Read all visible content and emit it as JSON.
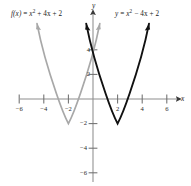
{
  "figure": {
    "axes": {
      "x_name": "x",
      "y_name": "y"
    },
    "labels": {
      "left_eq_fn": "f(x)",
      "left_eq_eq": " = ",
      "left_eq_x": "x",
      "left_eq_pow": "2",
      "left_eq_rest": " + 4x + 2",
      "right_eq_fn": "y",
      "right_eq_eq": " = ",
      "right_eq_x": "x",
      "right_eq_pow": "2",
      "right_eq_rest": " − 4x + 2"
    }
  },
  "chart_data": {
    "type": "line",
    "title": "",
    "xlabel": "x",
    "ylabel": "y",
    "xlim": [
      -7.6,
      7.9
    ],
    "ylim": [
      -7.1,
      6.5
    ],
    "grid": false,
    "legend": "none",
    "xticks": [
      -6,
      -4,
      -2,
      2,
      4,
      6
    ],
    "xtick_labels": [
      "−6",
      "−4",
      "−2",
      "2",
      "4",
      "6"
    ],
    "yticks": [
      4,
      2,
      -2,
      -4,
      -6
    ],
    "ytick_labels": [
      "4",
      "2",
      "−2",
      "−4",
      "−6"
    ],
    "series": [
      {
        "name": "f(x) = x² + 4x + 2",
        "color": "#a8a8a8",
        "equation": "y = x^2 + 4x + 2",
        "vertex": [
          -2,
          -2
        ],
        "y_intercept": 2,
        "x_domain": [
          -4.55,
          0.55
        ],
        "x": [
          -4.55,
          -4.2,
          -3.8,
          -3.4,
          -3.0,
          -2.6,
          -2.2,
          -2.0,
          -1.8,
          -1.4,
          -1.0,
          -0.6,
          -0.2,
          0.2,
          0.55
        ],
        "y": [
          4.5,
          2.84,
          1.24,
          -0.04,
          -1.0,
          -1.64,
          -1.96,
          -2.0,
          -1.96,
          -1.64,
          -1.0,
          -0.04,
          1.24,
          2.84,
          4.5
        ]
      },
      {
        "name": "y = x² − 4x + 2",
        "color": "#111111",
        "equation": "y = x^2 - 4x + 2",
        "vertex": [
          2,
          -2
        ],
        "y_intercept": 2,
        "x_domain": [
          -0.55,
          4.55
        ],
        "x": [
          -0.55,
          -0.2,
          0.2,
          0.6,
          1.0,
          1.4,
          1.8,
          2.0,
          2.2,
          2.6,
          3.0,
          3.4,
          3.8,
          4.2,
          4.55
        ],
        "y": [
          4.5,
          2.84,
          1.24,
          -0.04,
          -1.0,
          -1.64,
          -1.96,
          -2.0,
          -1.96,
          -1.64,
          -1.0,
          -0.04,
          1.24,
          2.84,
          4.5
        ]
      }
    ],
    "annotations": [
      {
        "text": "f(x) = x² + 4x + 2",
        "x": -5.9,
        "y": 5.9
      },
      {
        "text": "y = x² − 4x + 2",
        "x": 2.2,
        "y": 5.9
      }
    ]
  }
}
